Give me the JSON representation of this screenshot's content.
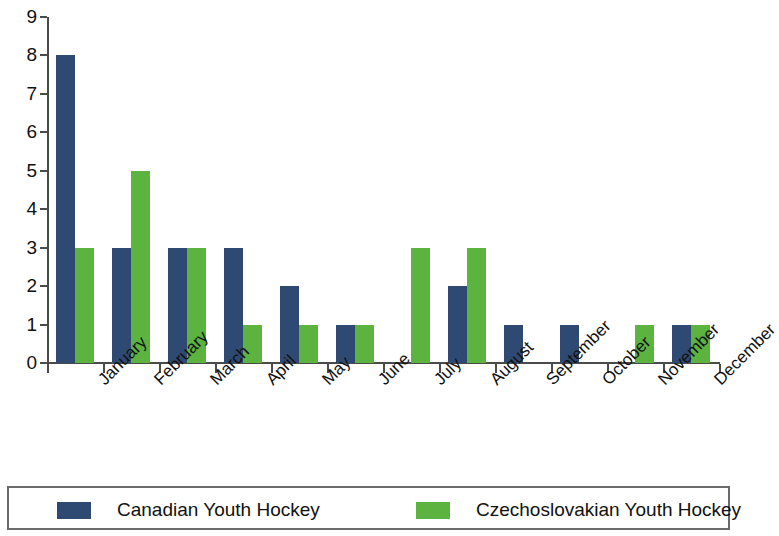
{
  "chart_data": {
    "type": "bar",
    "title": "",
    "subtitle": "",
    "xlabel": "",
    "ylabel": "",
    "ylim": [
      0,
      9
    ],
    "ytick_labels": [
      "0",
      "1",
      "2",
      "3",
      "4",
      "5",
      "6",
      "7",
      "8",
      "9"
    ],
    "ytick_values": [
      0,
      1,
      2,
      3,
      4,
      5,
      6,
      7,
      8,
      9
    ],
    "grid": false,
    "legend_position": "bottom",
    "categories": [
      "January",
      "February",
      "March",
      "April",
      "May",
      "June",
      "July",
      "August",
      "September",
      "October",
      "November",
      "December"
    ],
    "series": [
      {
        "name": "Canadian Youth Hockey",
        "color": "#2e4a72",
        "values": [
          8,
          3,
          3,
          3,
          2,
          1,
          0,
          2,
          1,
          1,
          0,
          1
        ]
      },
      {
        "name": "Czechoslovakian Youth Hockey",
        "color": "#5cb33f",
        "values": [
          3,
          5,
          3,
          1,
          1,
          1,
          3,
          3,
          0,
          0,
          1,
          1
        ]
      }
    ]
  },
  "legend": {
    "entries": [
      {
        "label": "Canadian Youth Hockey",
        "swatch": "blue"
      },
      {
        "label": "Czechoslovakian Youth Hockey",
        "swatch": "green"
      }
    ]
  },
  "colors": {
    "series_blue": "#2e4a72",
    "series_green": "#5cb33f",
    "axis": "#4a4a4a",
    "text": "#111111",
    "background": "#ffffff"
  }
}
